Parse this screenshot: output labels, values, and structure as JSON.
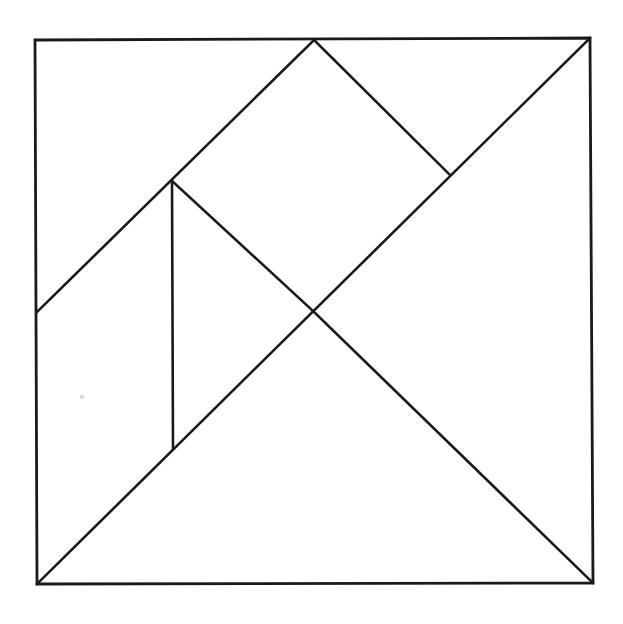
{
  "document": {
    "title": "Tangram Dissection",
    "description": "A square divided by straight lines into seven tangram pieces",
    "background_color": "#ffffff",
    "line_color": "#1a1a1a",
    "line_width_px": 2.6,
    "canvas": {
      "width": 623,
      "height": 624
    }
  },
  "figure": {
    "name": "tangram-square",
    "outline_name": "outer-square",
    "outline_points": "35,40 590,38 593,583 37,584",
    "vertices": {
      "top_left": {
        "x": 35,
        "y": 40
      },
      "top_right": {
        "x": 590,
        "y": 38
      },
      "bottom_right": {
        "x": 593,
        "y": 583
      },
      "bottom_left": {
        "x": 37,
        "y": 584
      },
      "top_apex": {
        "x": 314,
        "y": 40
      },
      "center": {
        "x": 313,
        "y": 311
      },
      "left_mid": {
        "x": 37,
        "y": 312
      },
      "right_notch": {
        "x": 450,
        "y": 175
      },
      "upper_node": {
        "x": 172,
        "y": 181
      },
      "lower_node": {
        "x": 173,
        "y": 448
      }
    },
    "lines": [
      {
        "name": "main-diagonal",
        "from": "top_right",
        "to": "bottom_left",
        "points": "590,38 37,584"
      },
      {
        "name": "apex-to-left-edge",
        "from": "top_apex",
        "to": "left_mid",
        "points": "314,40 37,312"
      },
      {
        "name": "apex-to-right-notch",
        "from": "top_apex",
        "to": "right_notch",
        "points": "314,40 450,175"
      },
      {
        "name": "upper-node-to-center",
        "from": "upper_node",
        "to": "center",
        "points": "172,181 313,311"
      },
      {
        "name": "vertical-divider",
        "from": "upper_node",
        "to": "lower_node",
        "points": "172,181 173,448"
      },
      {
        "name": "center-to-bottom-right",
        "from": "center",
        "to": "bottom_right",
        "points": "313,311 593,583"
      }
    ],
    "pieces": [
      {
        "name": "large-triangle-lower-right",
        "points": "37,584 593,583 313,311"
      },
      {
        "name": "large-triangle-upper-right",
        "points": "314,40 590,38 313,311"
      },
      {
        "name": "medium-triangle-upper-left",
        "points": "314,40 313,311 172,181"
      },
      {
        "name": "small-triangle-left",
        "points": "35,40 314,40 172,181"
      },
      {
        "name": "parallelogram-left",
        "points": "35,40 172,181 173,448 37,584 37,312"
      },
      {
        "name": "triangle-lower-middle",
        "points": "172,181 313,311 173,448"
      }
    ],
    "artifacts": [
      {
        "name": "scan-speck",
        "x": 82,
        "y": 397,
        "radius": 2.2
      }
    ]
  }
}
